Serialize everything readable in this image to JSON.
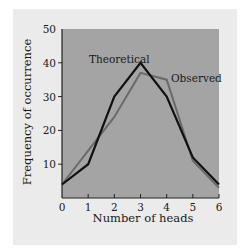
{
  "colors": {
    "panel_bg": "#ebebeb",
    "plot_bg": "#a4a4a4",
    "theoretical_line": "#111111",
    "observed_line": "#6a6a6a",
    "axis": "#222222"
  },
  "chart_data": {
    "type": "line",
    "title": "",
    "xlabel": "Number of heads",
    "ylabel": "Frequency of occurrence",
    "x": [
      0,
      1,
      2,
      3,
      4,
      5,
      6
    ],
    "xticks": [
      "0",
      "1",
      "2",
      "3",
      "4",
      "5",
      "6"
    ],
    "yticks": [
      "10",
      "20",
      "30",
      "40",
      "50"
    ],
    "xlim": [
      0,
      6
    ],
    "ylim": [
      0,
      50
    ],
    "grid": false,
    "legend": "inline labels",
    "series": [
      {
        "name": "Theoretical",
        "values": [
          4,
          10,
          30,
          40,
          30,
          12,
          4
        ]
      },
      {
        "name": "Observed",
        "values": [
          4,
          14,
          24,
          37,
          35,
          11,
          3
        ]
      }
    ],
    "annotations": [
      {
        "text": "Theoretical",
        "near_x": 3,
        "near_y": 40
      },
      {
        "text": "Observed",
        "near_x": 4,
        "near_y": 35
      }
    ]
  }
}
